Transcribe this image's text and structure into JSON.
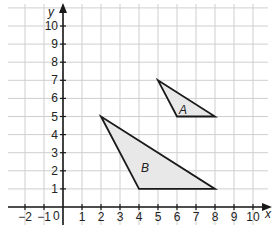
{
  "chart_data": {
    "type": "coordinate-grid",
    "xlabel": "x",
    "ylabel": "y",
    "origin_label": "0",
    "x_ticks": [
      "−2",
      "−1",
      "1",
      "2",
      "3",
      "4",
      "5",
      "6",
      "7",
      "8",
      "9",
      "10"
    ],
    "y_ticks": [
      "1",
      "2",
      "3",
      "4",
      "5",
      "6",
      "7",
      "8",
      "9",
      "10"
    ],
    "xlim": [
      -3,
      11
    ],
    "ylim": [
      -1,
      11
    ],
    "grid": true,
    "shapes": [
      {
        "name": "A",
        "type": "triangle",
        "vertices": [
          [
            5,
            7
          ],
          [
            6,
            5
          ],
          [
            8,
            5
          ]
        ],
        "fill": "#e6e6e6"
      },
      {
        "name": "B",
        "type": "triangle",
        "vertices": [
          [
            2,
            5
          ],
          [
            4,
            1
          ],
          [
            8,
            1
          ]
        ],
        "fill": "#e6e6e6"
      }
    ]
  },
  "labels": {
    "x_axis": "x",
    "y_axis": "y",
    "origin": "0",
    "triangle_a": "A",
    "triangle_b": "B"
  },
  "colors": {
    "grid": "#cfcfcf",
    "axis": "#1a1a1a",
    "shape_fill": "#e8e8e8",
    "shape_stroke": "#1a1a1a"
  }
}
